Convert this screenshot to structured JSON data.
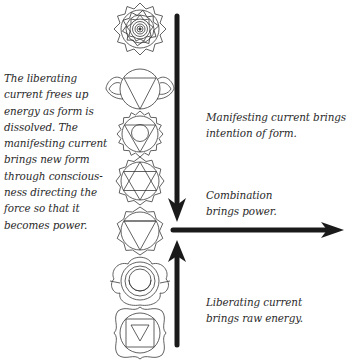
{
  "captions": {
    "left": "The liberating\ncurrent frees up\nenergy as form is\ndissolved. The\nmanifesting current\nbrings new form\nthrough conscious-\nness directing the\nforce so that it\nbecomes power.",
    "manifesting": "Manifesting current brings\nintention of form.",
    "combination": "Combination\nbrings power.",
    "liberating": "Liberating current\nbrings raw energy."
  },
  "chakras": [
    {
      "name": "crown",
      "symbol": "thousand-petal lotus"
    },
    {
      "name": "third-eye",
      "symbol": "two-petal lotus with downward triangle"
    },
    {
      "name": "throat",
      "symbol": "sixteen-petal lotus with triangle and circle"
    },
    {
      "name": "heart",
      "symbol": "twelve-petal lotus with hexagram"
    },
    {
      "name": "solar-plexus",
      "symbol": "ten-petal lotus with downward triangle"
    },
    {
      "name": "sacral",
      "symbol": "six-petal lotus with crescent"
    },
    {
      "name": "root",
      "symbol": "four-petal lotus with square and downward triangle"
    }
  ],
  "arrows": {
    "manifesting": "down",
    "combination": "right",
    "liberating": "up"
  },
  "colors": {
    "ink": "#1a1a1a",
    "line": "#3a3a3a",
    "background": "#ffffff"
  }
}
